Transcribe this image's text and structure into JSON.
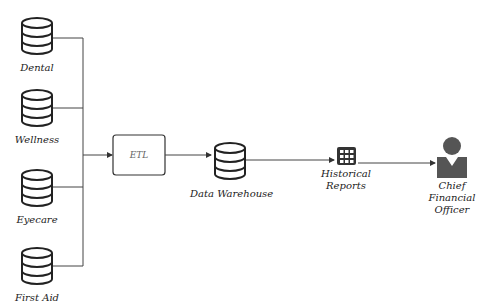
{
  "diagram": {
    "sources": [
      {
        "label": "Dental",
        "icon": "database-icon"
      },
      {
        "label": "Wellness",
        "icon": "database-icon"
      },
      {
        "label": "Eyecare",
        "icon": "database-icon"
      },
      {
        "label": "First Aid",
        "icon": "database-icon"
      }
    ],
    "etl": {
      "label": "ETL"
    },
    "warehouse": {
      "label": "Data Warehouse",
      "icon": "database-icon"
    },
    "reports": {
      "label_line1": "Historical",
      "label_line2": "Reports",
      "icon": "grid-icon"
    },
    "cfo": {
      "label_line1": "Chief",
      "label_line2": "Financial",
      "label_line3": "Officer",
      "icon": "person-icon"
    },
    "colors": {
      "stroke": "#222222",
      "line": "#444444",
      "person": "#555555"
    }
  }
}
